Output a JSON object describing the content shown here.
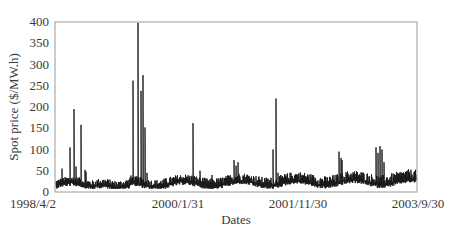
{
  "chart_data": {
    "type": "line",
    "title": "",
    "xlabel": "Dates",
    "ylabel": "Spot price ($/MW.h)",
    "ylim": [
      0,
      400
    ],
    "yticks": [
      0,
      50,
      100,
      150,
      200,
      250,
      300,
      350,
      400
    ],
    "xticks": [
      "1998/4/2",
      "2000/1/31",
      "2001/11/30",
      "2003/9/30"
    ],
    "xrange": [
      "1998/4/2",
      "2003/9/30"
    ],
    "grid": false,
    "legend": null,
    "line_color": "#1a1a1a",
    "baseline_range": [
      10,
      50
    ],
    "spikes": [
      {
        "date": "1998/5",
        "value": 55
      },
      {
        "date": "1998/7",
        "value": 105
      },
      {
        "date": "1998/8",
        "value": 195
      },
      {
        "date": "1998/9",
        "value": 60
      },
      {
        "date": "1998/10",
        "value": 158
      },
      {
        "date": "1998/11",
        "value": 52
      },
      {
        "date": "1999/8",
        "value": 262
      },
      {
        "date": "1999/9",
        "value": 398
      },
      {
        "date": "1999/10",
        "value": 238
      },
      {
        "date": "1999/10b",
        "value": 275
      },
      {
        "date": "1999/11",
        "value": 152
      },
      {
        "date": "2000/5",
        "value": 162
      },
      {
        "date": "2001/1",
        "value": 75
      },
      {
        "date": "2001/2",
        "value": 70
      },
      {
        "date": "2001/10",
        "value": 100
      },
      {
        "date": "2001/11",
        "value": 220
      },
      {
        "date": "2002/10",
        "value": 95
      },
      {
        "date": "2002/11",
        "value": 75
      },
      {
        "date": "2003/5",
        "value": 105
      },
      {
        "date": "2003/6",
        "value": 108
      }
    ]
  },
  "axes": {
    "y_ticks": [
      "0",
      "50",
      "100",
      "150",
      "200",
      "250",
      "300",
      "350",
      "400"
    ],
    "x_ticks": [
      "1998/4/2",
      "2000/1/31",
      "2001/11/30",
      "2003/9/30"
    ],
    "xlabel": "Dates",
    "ylabel": "Spot price ($/MW.h)"
  },
  "render": {
    "plot": {
      "left": 55,
      "top": 22,
      "right": 417,
      "bottom": 192
    },
    "spike_px": [
      [
        62,
        55
      ],
      [
        66,
        30
      ],
      [
        70,
        105
      ],
      [
        74,
        195
      ],
      [
        76,
        60
      ],
      [
        81,
        158
      ],
      [
        85,
        52
      ],
      [
        86,
        48
      ],
      [
        133,
        262
      ],
      [
        138,
        398
      ],
      [
        141,
        238
      ],
      [
        143,
        275
      ],
      [
        145,
        152
      ],
      [
        147,
        45
      ],
      [
        193,
        162
      ],
      [
        200,
        50
      ],
      [
        212,
        40
      ],
      [
        234,
        75
      ],
      [
        236,
        62
      ],
      [
        238,
        70
      ],
      [
        273,
        100
      ],
      [
        276,
        220
      ],
      [
        278,
        45
      ],
      [
        339,
        95
      ],
      [
        341,
        80
      ],
      [
        342,
        75
      ],
      [
        376,
        105
      ],
      [
        378,
        92
      ],
      [
        380,
        108
      ],
      [
        382,
        100
      ],
      [
        384,
        70
      ]
    ]
  }
}
